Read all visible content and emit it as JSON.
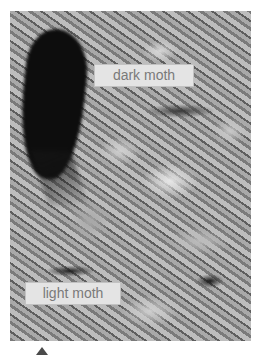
{
  "photo": {
    "subject": "moths on lichen-covered bark",
    "labels": {
      "dark": "dark moth",
      "light": "light moth"
    }
  },
  "arrow": {
    "icon": "triangle-up-icon",
    "color": "#4a4a4a"
  }
}
